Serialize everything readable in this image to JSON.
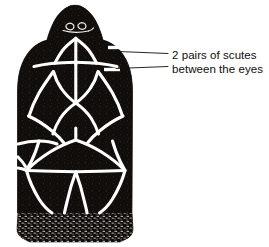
{
  "figure": {
    "ink_color": "#100d0b",
    "seam_color": "#ffffff",
    "background_color": "#ffffff",
    "leader_line_color": "#100d0b"
  },
  "annotation": {
    "line1": "2 pairs of scutes",
    "line2": "between the eyes",
    "leaders": [
      {
        "name": "upper-leader-line",
        "x1": 118,
        "y1": 51.5,
        "x2": 168,
        "y2": 53.5
      },
      {
        "name": "lower-leader-line",
        "x1": 116,
        "y1": 68.5,
        "x2": 168,
        "y2": 66.5
      }
    ],
    "tick_marks": [
      {
        "name": "upper-scute-tick",
        "x1": 108,
        "y1": 47.5,
        "x2": 122,
        "y2": 47.5
      },
      {
        "name": "lower-scute-tick",
        "x1": 104,
        "y1": 69.5,
        "x2": 120,
        "y2": 69.5
      }
    ]
  },
  "illustration_paths": {
    "head_outline": "M 69.5 6 C 63 9 58 14 54.5 20.5 C 51 27 48.5 34 47 40 C 41 41.5 35 45 30.5 50 C 25.5 55.5 22 62.5 20 70 C 18 77.5 17.5 85 17.5 92 L 17.5 213 L 132 213 L 132.5 92 C 132.5 85 132 77.5 130 70 C 128 62.5 124.5 55.5 119.5 50 C 115 45 109 41.5 103 40 C 101.5 34 99 27 95.5 20.5 C 92 14 87 9 80.5 6 C 78 5 72 5 69.5 6 Z",
    "neck_band": "M 18 213 L 132 213 L 133 229 C 133 233 131 236 128 238 L 120 242 L 30 242 L 22 238 C 19 236 17 233 17 229 Z",
    "seams": [
      {
        "name": "snout-v-left",
        "d": "M 75 39 C 71 42 66 46 62.5 50.5 C 59.5 54.5 57 59 55 63"
      },
      {
        "name": "snout-v-right",
        "d": "M 76.5 39 C 80.5 42 85.5 46 89 50.5 C 92 54.5 94.5 59 96.5 63"
      },
      {
        "name": "snout-midline",
        "d": "M 75.8 38 L 75.8 64"
      },
      {
        "name": "interorbital-cross-left",
        "d": "M 34 66.5 C 45 63.5 58 62.5 75.5 62.2"
      },
      {
        "name": "interorbital-cross-right",
        "d": "M 75.5 62.2 C 93 62.5 106 63.5 117 66.5"
      },
      {
        "name": "frontal-midline",
        "d": "M 75.8 62.2 L 75.8 103"
      },
      {
        "name": "frontal-left-edge",
        "d": "M 75.8 103 C 70 99 65 94 61 88 C 57.5 83 55 77 53.5 71.5"
      },
      {
        "name": "frontal-right-edge",
        "d": "M 75.8 103 C 81.5 99 86.5 94 90.5 88 C 94 83 96.5 77 98 71.5"
      },
      {
        "name": "left-supraocular",
        "d": "M 53 72 C 48 79 43 86 39 93 C 35 100 31.5 108 29 116"
      },
      {
        "name": "right-supraocular",
        "d": "M 98.5 72 C 103.5 79 108.5 86 112.5 93 C 116.5 100 120 108 122.5 116"
      },
      {
        "name": "parietal-left",
        "d": "M 75.8 103 C 70 107 64.5 112 60.5 118 C 57 123.5 54.5 129 53 134"
      },
      {
        "name": "parietal-right",
        "d": "M 75.8 103 C 81.5 107 87 112 91 118 C 94.5 123.5 97 129 98.5 134"
      },
      {
        "name": "parietal-midline",
        "d": "M 75.8 128 L 75.8 140"
      },
      {
        "name": "occipital-left",
        "d": "M 75.8 140 C 67 143 58 147 50 152 C 42 157 34 163 27 170"
      },
      {
        "name": "occipital-right",
        "d": "M 75.8 140 C 84.5 143 93.5 147 101.5 152 C 109.5 157 117.5 163 124.5 170"
      },
      {
        "name": "left-lateral-seam",
        "d": "M 28.5 116 C 37 120 45 125 52 131 C 57 135 61 139 64 143"
      },
      {
        "name": "right-lateral-seam",
        "d": "M 123 116 C 114.5 120 106.5 125 99.5 131 C 94.5 135 90.5 139 87.5 143"
      },
      {
        "name": "left-temporal-branch",
        "d": "M 18 144 C 25 142 32 141 39 141 C 46 141 52 142 57 144"
      },
      {
        "name": "left-temporal-down",
        "d": "M 39 141 C 37 148 34.5 155 31.5 161 C 29 166 27.5 168.5 26.5 170.5"
      },
      {
        "name": "right-temporal-down",
        "d": "M 112.5 141 C 114.5 148 117 155 120 161 C 122.5 166 124 168.5 125 170.5"
      },
      {
        "name": "left-nape-seam",
        "d": "M 26.5 170.5 C 29 180 33.5 190 39 199 C 44 207 49 211 52 213"
      },
      {
        "name": "right-nape-seam",
        "d": "M 125 170.5 C 122.5 180 118 190 112.5 199 C 107.5 207 102.5 211 99.5 213"
      },
      {
        "name": "mid-nape-left",
        "d": "M 75.8 172 C 72 182 69 193 67 202 C 65.5 208 64.8 211 64.5 213"
      },
      {
        "name": "mid-nape-right",
        "d": "M 75.8 172 C 79.5 182 82.5 193 84.5 202 C 86 208 86.8 211 87 213"
      },
      {
        "name": "nape-apex-left",
        "d": "M 27 170.5 C 40 171 55 171.5 75.8 171.8"
      },
      {
        "name": "nape-apex-right",
        "d": "M 75.8 171.8 C 96.5 171.5 111.5 171 124.5 170.5"
      },
      {
        "name": "left-lower-branch",
        "d": "M 18 168 C 22 168.5 25 169.5 27 170.5"
      },
      {
        "name": "left-lower-branch-2",
        "d": "M 18 157 C 21 160 23.5 163 25.5 166.5"
      }
    ],
    "snout_detail": [
      {
        "name": "nostril-left",
        "d": "M 66 25.5 C 67.5 23.5 70 22.8 72 23.8 C 74 24.8 74.5 27 73.2 28.6 C 71.8 30.2 69 30.2 67.3 28.8 C 66.3 28 65.8 26.6 66 25.5 Z"
      },
      {
        "name": "nostril-right",
        "d": "M 78 25 C 79.5 23 82 22.3 84 23.3 C 86 24.3 86.5 26.5 85.2 28.1 C 83.8 29.7 81 29.7 79.3 28.3 C 78.3 27.5 77.8 26.1 78 25 Z"
      },
      {
        "name": "beak-line",
        "d": "M 63 30.5 C 70 32.5 80 32.8 88.5 31"
      },
      {
        "name": "beak-tail",
        "d": "M 88.5 31 C 91 30.5 92.5 29.5 93.5 28"
      }
    ]
  }
}
